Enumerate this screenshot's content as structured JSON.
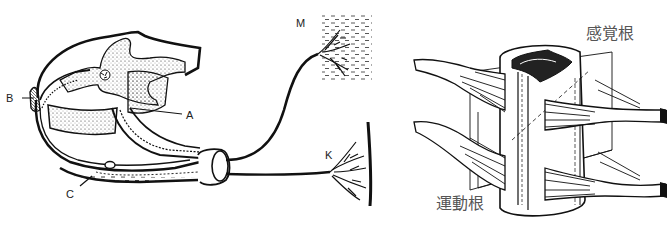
{
  "left_diagram": {
    "labels": {
      "A": "A",
      "B": "B",
      "C": "C",
      "M": "M",
      "K": "K"
    }
  },
  "right_diagram": {
    "labels": {
      "sensory_root": "感覚根",
      "motor_root": "運動根"
    }
  },
  "colors": {
    "ink": "#111111",
    "label_gray": "#555555",
    "background": "#ffffff"
  }
}
